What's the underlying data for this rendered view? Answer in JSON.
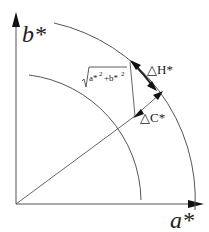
{
  "diagram": {
    "title": "",
    "axes": {
      "x_label": "a*",
      "y_label": "b*"
    },
    "labels": {
      "delta_h": "△H*",
      "delta_c": "△C*",
      "chroma_formula": "√(a*²+b*²)",
      "chroma_radicand_a": "a*",
      "chroma_radicand_sup": "2",
      "chroma_plus": "+b*",
      "chroma_radicand_sup2": "2"
    },
    "elements": [
      {
        "type": "axis",
        "name": "b* axis",
        "direction": "up"
      },
      {
        "type": "axis",
        "name": "a* axis",
        "direction": "right"
      },
      {
        "type": "arc",
        "name": "inner chroma circle"
      },
      {
        "type": "arc",
        "name": "outer chroma circle"
      },
      {
        "type": "vector",
        "name": "radial line from origin"
      },
      {
        "type": "vector",
        "name": "delta C* arrow (radial)"
      },
      {
        "type": "vector",
        "name": "delta H* arrow (tangential along outer arc)"
      },
      {
        "type": "line",
        "name": "chroma hypotenuse line"
      }
    ],
    "colors": {
      "line": "#555555",
      "arrow": "#111111",
      "text": "#222222",
      "background": "#ffffff"
    }
  }
}
